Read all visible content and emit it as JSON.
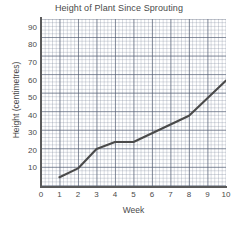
{
  "chart_data": {
    "type": "line",
    "title": "Height of Plant Since Sprouting",
    "xlabel": "Week",
    "ylabel": "Height (centimetres)",
    "x": [
      1,
      2,
      3,
      4,
      5,
      8,
      10
    ],
    "values": [
      5,
      10,
      21,
      25,
      25,
      40,
      60
    ],
    "series": [
      {
        "name": "Plant height",
        "points": [
          {
            "week": 1,
            "height": 5
          },
          {
            "week": 2,
            "height": 10
          },
          {
            "week": 3,
            "height": 21
          },
          {
            "week": 4,
            "height": 25
          },
          {
            "week": 5,
            "height": 25
          },
          {
            "week": 8,
            "height": 40
          },
          {
            "week": 10,
            "height": 60
          }
        ]
      }
    ],
    "xlim": [
      0,
      10
    ],
    "ylim": [
      0,
      95
    ],
    "x_ticks": [
      "0",
      "1",
      "2",
      "3",
      "4",
      "5",
      "6",
      "7",
      "8",
      "9",
      "10"
    ],
    "y_ticks": [
      "10",
      "20",
      "30",
      "40",
      "50",
      "60",
      "70",
      "80",
      "90"
    ],
    "grid": true,
    "grid_style": "graph-paper",
    "legend": false,
    "line_color": "#4a4a4a",
    "grid_color": "#7a8596",
    "axis_color": "#5a5a5a"
  }
}
